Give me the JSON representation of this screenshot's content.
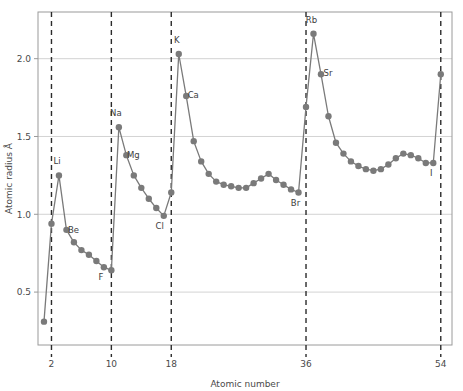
{
  "chart_data": {
    "type": "line",
    "title": "",
    "xlabel": "Atomic number",
    "ylabel": "Atomic radius Å",
    "xlim": [
      0.2,
      55.5
    ],
    "ylim": [
      0.16,
      2.3
    ],
    "grid": true,
    "gridlines_y": [
      0.5,
      1.0,
      1.5,
      2.0
    ],
    "xticks": [
      2,
      10,
      18,
      36,
      54
    ],
    "xtick_labels": [
      "2",
      "10",
      "18",
      "36",
      "54"
    ],
    "yticks": [
      0.5,
      1.0,
      1.5,
      2.0
    ],
    "ytick_labels": [
      "0.5",
      "1.0",
      "1.5",
      "2.0"
    ],
    "legend": null,
    "legend_position": "none",
    "series_name": "Atomic radius",
    "line_color": "#7a7a7a",
    "marker_color": "#7a7a7a",
    "marker_shape": "circle",
    "marker_size": 3.2,
    "vline_color": "#2b2b2b",
    "vline_style": "dashed",
    "vlines": [
      2,
      10,
      18,
      36,
      54
    ],
    "grid_color": "#c8c8c8",
    "frame_color": "#9a9a9a",
    "x": [
      1,
      2,
      3,
      4,
      5,
      6,
      7,
      8,
      9,
      10,
      11,
      12,
      13,
      14,
      15,
      16,
      17,
      18,
      19,
      20,
      21,
      22,
      23,
      24,
      25,
      26,
      27,
      28,
      29,
      30,
      31,
      32,
      33,
      34,
      35,
      36,
      37,
      38,
      39,
      40,
      41,
      42,
      43,
      44,
      45,
      46,
      47,
      48,
      49,
      50,
      51,
      52,
      53,
      54
    ],
    "y": [
      0.31,
      0.94,
      1.25,
      0.9,
      0.82,
      0.77,
      0.74,
      0.7,
      0.66,
      0.64,
      1.56,
      1.38,
      1.25,
      1.17,
      1.1,
      1.04,
      0.99,
      1.14,
      2.03,
      1.76,
      1.47,
      1.34,
      1.26,
      1.21,
      1.19,
      1.18,
      1.17,
      1.17,
      1.2,
      1.23,
      1.26,
      1.22,
      1.19,
      1.16,
      1.14,
      1.69,
      2.16,
      1.9,
      1.63,
      1.46,
      1.39,
      1.34,
      1.31,
      1.29,
      1.28,
      1.29,
      1.32,
      1.36,
      1.39,
      1.38,
      1.36,
      1.33,
      1.33,
      1.9
    ],
    "annotations": [
      {
        "label": "Li",
        "x": 3,
        "y": 1.25,
        "dx": -2,
        "dy": -11
      },
      {
        "label": "Be",
        "x": 4,
        "y": 0.9,
        "dx": 7,
        "dy": 3
      },
      {
        "label": "F",
        "x": 9,
        "y": 0.66,
        "dx": -3,
        "dy": 13
      },
      {
        "label": "Na",
        "x": 11,
        "y": 1.56,
        "dx": -3,
        "dy": -11
      },
      {
        "label": "Mg",
        "x": 12,
        "y": 1.38,
        "dx": 7,
        "dy": 3
      },
      {
        "label": "Cl",
        "x": 17,
        "y": 0.99,
        "dx": -4,
        "dy": 13
      },
      {
        "label": "K",
        "x": 19,
        "y": 2.03,
        "dx": -2,
        "dy": -11
      },
      {
        "label": "Ca",
        "x": 20,
        "y": 1.76,
        "dx": 7,
        "dy": 2
      },
      {
        "label": "Br",
        "x": 35,
        "y": 1.14,
        "dx": -3,
        "dy": 13
      },
      {
        "label": "Rb",
        "x": 37,
        "y": 2.16,
        "dx": -2,
        "dy": -11
      },
      {
        "label": "Sr",
        "x": 38,
        "y": 1.9,
        "dx": 7,
        "dy": 2
      },
      {
        "label": "I",
        "x": 53,
        "y": 1.33,
        "dx": -2,
        "dy": 13
      }
    ]
  }
}
